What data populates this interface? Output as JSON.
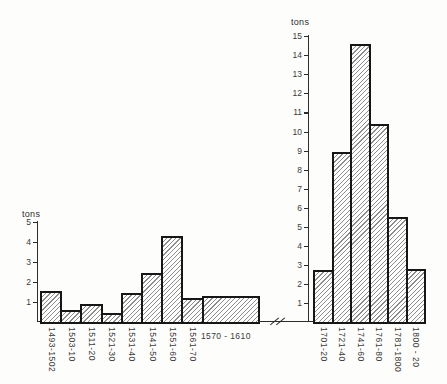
{
  "figure": {
    "kind": "scanned-double-histogram",
    "background": "#fdfdfb"
  },
  "colors": {
    "ink": "#2c2c2c",
    "bar_outline": "#161616",
    "hatch_line": "#8d8d8d",
    "text": "#3a3a3a"
  },
  "axis_break": {
    "present": true,
    "symbol": "//"
  },
  "chart_data": [
    {
      "type": "bar",
      "title": "",
      "ylabel": "tons",
      "xlabel": "",
      "ylim": [
        0,
        5
      ],
      "yticks": [
        1,
        2,
        3,
        4,
        5
      ],
      "grid": false,
      "legend": null,
      "categories": [
        "1493-1502",
        "1503-10",
        "1511-20",
        "1521-30",
        "1531-40",
        "1541-50",
        "1551-60",
        "1561-70",
        "1570 - 1610"
      ],
      "values": [
        1.55,
        0.6,
        0.9,
        0.45,
        1.45,
        2.45,
        4.3,
        1.2,
        1.3
      ],
      "bar_relative_widths": [
        1,
        1,
        1,
        1,
        1,
        1,
        1,
        1,
        2.8
      ],
      "last_label_horizontal": true,
      "hatch": "diagonal-forward"
    },
    {
      "type": "bar",
      "title": "",
      "ylabel": "tons",
      "xlabel": "",
      "ylim": [
        0,
        15
      ],
      "yticks": [
        1,
        2,
        3,
        4,
        5,
        6,
        7,
        8,
        9,
        10,
        11,
        12,
        13,
        14,
        15
      ],
      "grid": false,
      "legend": null,
      "categories": [
        "1701-20",
        "1721-40",
        "1741-60",
        "1761-80",
        "1781-1800",
        "1800 - 20"
      ],
      "values": [
        2.75,
        8.9,
        14.6,
        10.4,
        5.5,
        2.8
      ],
      "bar_relative_widths": [
        1,
        1,
        1,
        1,
        1,
        1
      ],
      "last_label_horizontal": false,
      "hatch": "diagonal-forward"
    }
  ]
}
